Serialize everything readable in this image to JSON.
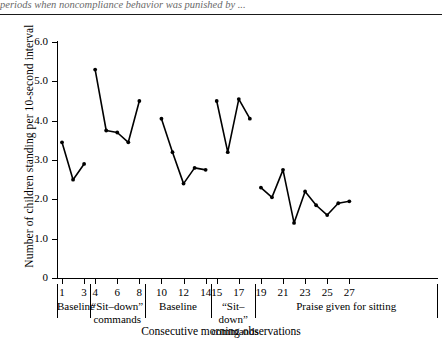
{
  "caption_fragment": "periods when noncompliance behavior was punished by ...",
  "chart_data": {
    "type": "line",
    "title": "",
    "xlabel": "Consecutive morning observations",
    "ylabel": "Number of children standing per 10-second interval",
    "xlim": [
      0,
      28
    ],
    "ylim": [
      0,
      6.0
    ],
    "grid": false,
    "legend": "none",
    "ytick_labels": [
      "0",
      "1.0",
      "2.0",
      "3.0",
      "4.0",
      "5.0",
      "6.0"
    ],
    "ytick_values": [
      0,
      1.0,
      2.0,
      3.0,
      4.0,
      5.0,
      6.0
    ],
    "xtick_labels": [
      "1",
      "3",
      "4",
      "6",
      "8",
      "10",
      "12",
      "14",
      "15",
      "17",
      "19",
      "21",
      "23",
      "25",
      "27"
    ],
    "xtick_values": [
      1,
      3,
      4,
      6,
      8,
      10,
      12,
      14,
      15,
      17,
      19,
      21,
      23,
      25,
      27
    ],
    "phases": [
      {
        "label": "Baseline",
        "label_line2": "",
        "start": 1,
        "end": 3
      },
      {
        "label": "“Sit–down”",
        "label_line2": "commands",
        "start": 4,
        "end": 8
      },
      {
        "label": "Baseline",
        "label_line2": "",
        "start": 9,
        "end": 14
      },
      {
        "label": "“Sit–down”",
        "label_line2": "commands",
        "start": 15,
        "end": 18
      },
      {
        "label": "Praise given for sitting",
        "label_line2": "",
        "start": 19,
        "end": 27
      }
    ],
    "series": [
      {
        "name": "Baseline 1",
        "x": [
          1,
          2,
          3
        ],
        "values": [
          3.45,
          2.5,
          2.9
        ]
      },
      {
        "name": "Sit-down commands 1",
        "x": [
          4,
          5,
          6,
          7,
          8
        ],
        "values": [
          5.3,
          3.75,
          3.7,
          3.45,
          4.5
        ]
      },
      {
        "name": "Baseline 2",
        "x": [
          10,
          11,
          12,
          13,
          14
        ],
        "values": [
          4.05,
          3.2,
          2.4,
          2.8,
          2.75
        ]
      },
      {
        "name": "Sit-down commands 2",
        "x": [
          15,
          16,
          17,
          18
        ],
        "values": [
          4.5,
          3.2,
          4.55,
          4.05
        ]
      },
      {
        "name": "Praise given for sitting",
        "x": [
          19,
          20,
          21,
          22,
          23,
          24,
          25,
          26,
          27
        ],
        "values": [
          2.3,
          2.05,
          2.75,
          1.4,
          2.2,
          1.85,
          1.6,
          1.9,
          1.95
        ]
      }
    ]
  }
}
